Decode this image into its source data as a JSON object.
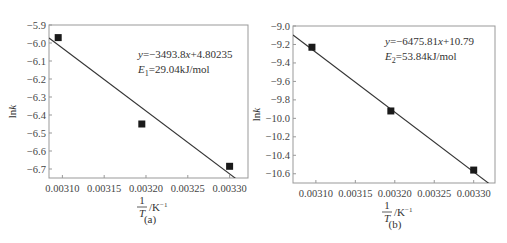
{
  "chart_data": [
    {
      "id": "a",
      "type": "scatter",
      "subtitle": "(a)",
      "title": "",
      "xlabel": "1/T / K^-1",
      "xlabel_num": "1",
      "xlabel_den": "T",
      "xlabel_unit": "/K",
      "xlabel_exp": "-1",
      "ylabel": "lnk",
      "xlim": [
        0.003084,
        0.003322
      ],
      "ylim": [
        -6.75,
        -5.9
      ],
      "xticks": [
        0.0031,
        0.00315,
        0.0032,
        0.00325,
        0.0033
      ],
      "xtick_labels": [
        "0.00310",
        "0.00315",
        "0.00320",
        "0.00325",
        "0.00330"
      ],
      "yticks": [
        -5.9,
        -6.0,
        -6.1,
        -6.2,
        -6.3,
        -6.4,
        -6.5,
        -6.6,
        -6.7
      ],
      "ytick_labels": [
        "-5.9",
        "-6.0",
        "-6.1",
        "-6.2",
        "-6.3",
        "-6.4",
        "-6.5",
        "-6.6",
        "-6.7"
      ],
      "points": [
        {
          "x": 0.003095,
          "y": -5.97
        },
        {
          "x": 0.003195,
          "y": -6.45
        },
        {
          "x": 0.0033,
          "y": -6.685
        }
      ],
      "fit": {
        "slope": -3493.8,
        "intercept": 4.80235
      },
      "annotation": {
        "equation": "y=-3493.8x+4.80235",
        "eq_prefix": "y",
        "eq_mid": "=-3493.8",
        "eq_var": "x",
        "eq_suffix": "+4.80235",
        "energy_sym": "E",
        "energy_sub": "1",
        "energy_val": "=29.04kJ/mol"
      },
      "grid": false
    },
    {
      "id": "b",
      "type": "scatter",
      "subtitle": "(b)",
      "title": "",
      "xlabel": "1/T / K^-1",
      "xlabel_num": "1",
      "xlabel_den": "T",
      "xlabel_unit": "/K",
      "xlabel_exp": "-1",
      "ylabel": "lnk",
      "xlim": [
        0.003071,
        0.003327
      ],
      "ylim": [
        -10.7,
        -9.0
      ],
      "xticks": [
        0.0031,
        0.00315,
        0.0032,
        0.00325,
        0.0033
      ],
      "xtick_labels": [
        "0.00310",
        "0.00315",
        "0.00320",
        "0.00325",
        "0.00330"
      ],
      "yticks": [
        -9.0,
        -9.2,
        -9.4,
        -9.6,
        -9.8,
        -10.0,
        -10.2,
        -10.4,
        -10.6
      ],
      "ytick_labels": [
        "-9.0",
        "-9.2",
        "-9.4",
        "-9.6",
        "-9.8",
        "-10.0",
        "-10.2",
        "-10.4",
        "-10.6"
      ],
      "points": [
        {
          "x": 0.003095,
          "y": -9.23
        },
        {
          "x": 0.003195,
          "y": -9.92
        },
        {
          "x": 0.0033,
          "y": -10.56
        }
      ],
      "fit": {
        "slope": -6475.81,
        "intercept": 10.79
      },
      "annotation": {
        "equation": "y=-6475.81x+10.79",
        "eq_prefix": "y",
        "eq_mid": "=-6475.81",
        "eq_var": "x",
        "eq_suffix": "+10.79",
        "energy_sym": "E",
        "energy_sub": "2",
        "energy_val": "=53.84kJ/mol"
      },
      "grid": false
    }
  ],
  "layout": {
    "panels": [
      {
        "left": 49,
        "top": 25,
        "right": 248,
        "bottom": 178,
        "ann_x": 138,
        "ann_y": 58,
        "label_cx": 150
      },
      {
        "left": 293,
        "top": 26,
        "right": 495,
        "bottom": 183,
        "ann_x": 385,
        "ann_y": 45,
        "label_cx": 395
      }
    ],
    "colors": {
      "axis": "#999999",
      "line": "#333333",
      "marker": "#1a1a1a"
    }
  }
}
